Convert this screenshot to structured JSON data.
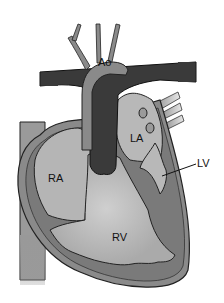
{
  "diagram": {
    "labels": {
      "ao": "Ao",
      "la": "LA",
      "lv": "LV",
      "ra": "RA",
      "rv": "RV"
    },
    "colors": {
      "background": "#ffffff",
      "dark_vessel": "#3a3a3a",
      "aorta": "#8a8a8a",
      "chamber_light": "#b0b0b0",
      "myocardium": "#7a7a7a",
      "outline": "#222222"
    }
  }
}
